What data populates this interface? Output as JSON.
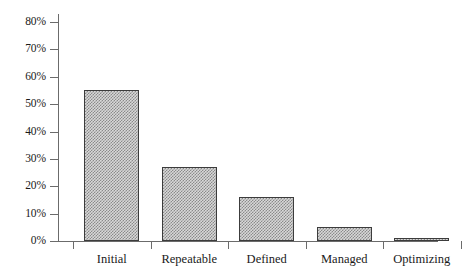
{
  "chart_data": {
    "type": "bar",
    "title": "",
    "subtitle": "",
    "xlabel": "",
    "ylabel": "",
    "categories": [
      "Initial",
      "Repeatable",
      "Defined",
      "Managed",
      "Optimizing"
    ],
    "values": [
      55,
      27,
      16,
      5,
      1
    ],
    "value_labels": [
      "55%",
      "27%",
      "16%",
      "5%",
      "1%"
    ],
    "ylim": [
      0,
      80
    ],
    "ytick_step": 10,
    "ytick_labels": [
      "0%",
      "10%",
      "20%",
      "30%",
      "40%",
      "50%",
      "60%",
      "70%",
      "80%"
    ],
    "ytick_values": [
      0,
      10,
      20,
      30,
      40,
      50,
      60,
      70,
      80
    ],
    "grid": false,
    "legend": null,
    "legend_position": "none",
    "series": [
      {
        "name": "Share of organizations",
        "values": [
          55,
          27,
          16,
          5,
          1
        ],
        "fill": "checkered-halftone",
        "fill_color": "#8a8a8a",
        "border_color": "#3c3c3c"
      }
    ],
    "axis_color": "#6b6b6b",
    "background_color": "#ffffff"
  }
}
